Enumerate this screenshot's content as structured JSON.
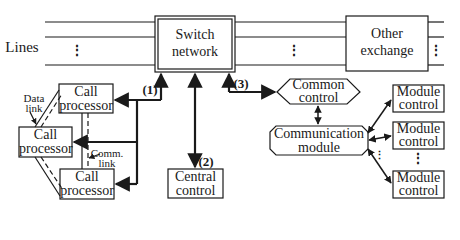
{
  "diagram": {
    "lines_label": "Lines",
    "switch_network": {
      "line1": "Switch",
      "line2": "network"
    },
    "other_exchange": {
      "line1": "Other",
      "line2": "exchange"
    },
    "call_processors": [
      {
        "line1": "Call",
        "line2": "processor"
      },
      {
        "line1": "Call",
        "line2": "processor"
      },
      {
        "line1": "Call",
        "line2": "processor"
      }
    ],
    "central_control": {
      "line1": "Central",
      "line2": "control"
    },
    "common_control": {
      "line1": "Common",
      "line2": "control"
    },
    "communication_module": {
      "line1": "Communication",
      "line2": "module"
    },
    "module_controls": [
      {
        "line1": "Module",
        "line2": "control"
      },
      {
        "line1": "Module",
        "line2": "control"
      },
      {
        "line1": "Module",
        "line2": "control"
      }
    ],
    "data_link": {
      "line1": "Data",
      "line2": "link"
    },
    "comm_link": {
      "line1": "Comm.",
      "line2": "link"
    },
    "path_labels": {
      "p1": "(1)",
      "p2": "(2)",
      "p3": "(3)"
    },
    "ellipsis": "⋮",
    "colors": {
      "stroke": "#1a1a1a",
      "background": "#ffffff"
    }
  }
}
